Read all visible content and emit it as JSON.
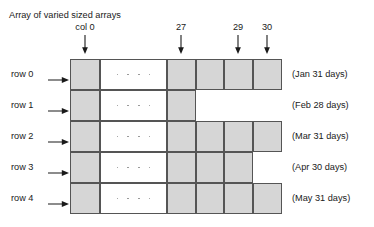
{
  "figure": {
    "title": "Array of varied sized arrays",
    "width": 374,
    "height": 227,
    "colors": {
      "cell_fill": "#d6d6d6",
      "cell_border": "#555555",
      "background": "#ffffff",
      "text": "#1a1a1a",
      "ellipsis_dot": "#8c8c8c"
    }
  },
  "column_headers": [
    {
      "label": "col 0",
      "arrow_icon": "arrow-down-icon",
      "x": 85
    },
    {
      "label": "27",
      "arrow_icon": "arrow-down-icon",
      "x": 181
    },
    {
      "label": "29",
      "arrow_icon": "arrow-down-icon",
      "x": 238
    },
    {
      "label": "30",
      "arrow_icon": "arrow-down-icon",
      "x": 267
    }
  ],
  "rows": [
    {
      "label": "row 0",
      "arrow_icon": "arrow-right-icon",
      "caption": "(Jan 31 days)",
      "month": "Jan",
      "days": 31,
      "y": 59,
      "height": 31,
      "ellipsis": true,
      "segments": [
        {
          "kind": "gray",
          "x": 70,
          "w": 30
        },
        {
          "kind": "white",
          "x": 100,
          "w": 67
        },
        {
          "kind": "gray",
          "x": 167,
          "w": 29
        },
        {
          "kind": "gray",
          "x": 196,
          "w": 28
        },
        {
          "kind": "gray",
          "x": 224,
          "w": 29
        },
        {
          "kind": "gray",
          "x": 253,
          "w": 29
        }
      ]
    },
    {
      "label": "row 1",
      "arrow_icon": "arrow-right-icon",
      "caption": "(Feb 28 days)",
      "month": "Feb",
      "days": 28,
      "y": 90,
      "height": 31,
      "ellipsis": true,
      "segments": [
        {
          "kind": "gray",
          "x": 70,
          "w": 30
        },
        {
          "kind": "white",
          "x": 100,
          "w": 67
        },
        {
          "kind": "gray",
          "x": 167,
          "w": 29
        }
      ]
    },
    {
      "label": "row 2",
      "arrow_icon": "arrow-right-icon",
      "caption": "(Mar 31 days)",
      "month": "Mar",
      "days": 31,
      "y": 121,
      "height": 31,
      "ellipsis": true,
      "segments": [
        {
          "kind": "gray",
          "x": 70,
          "w": 30
        },
        {
          "kind": "white",
          "x": 100,
          "w": 67
        },
        {
          "kind": "gray",
          "x": 167,
          "w": 29
        },
        {
          "kind": "gray",
          "x": 196,
          "w": 28
        },
        {
          "kind": "gray",
          "x": 224,
          "w": 29
        },
        {
          "kind": "gray",
          "x": 253,
          "w": 29
        }
      ]
    },
    {
      "label": "row 3",
      "arrow_icon": "arrow-right-icon",
      "caption": "(Apr 30 days)",
      "month": "Apr",
      "days": 30,
      "y": 152,
      "height": 31,
      "ellipsis": true,
      "segments": [
        {
          "kind": "gray",
          "x": 70,
          "w": 30
        },
        {
          "kind": "white",
          "x": 100,
          "w": 67
        },
        {
          "kind": "gray",
          "x": 167,
          "w": 29
        },
        {
          "kind": "gray",
          "x": 196,
          "w": 28
        },
        {
          "kind": "gray",
          "x": 224,
          "w": 29
        }
      ]
    },
    {
      "label": "row 4",
      "arrow_icon": "arrow-right-icon",
      "caption": "(May 31 days)",
      "month": "May",
      "days": 31,
      "y": 183,
      "height": 31,
      "ellipsis": true,
      "segments": [
        {
          "kind": "gray",
          "x": 70,
          "w": 30
        },
        {
          "kind": "white",
          "x": 100,
          "w": 67
        },
        {
          "kind": "gray",
          "x": 167,
          "w": 29
        },
        {
          "kind": "gray",
          "x": 196,
          "w": 28
        },
        {
          "kind": "gray",
          "x": 224,
          "w": 29
        },
        {
          "kind": "gray",
          "x": 253,
          "w": 29
        }
      ]
    }
  ],
  "row_label_x": 62,
  "ellipsis_dot_count": 4
}
